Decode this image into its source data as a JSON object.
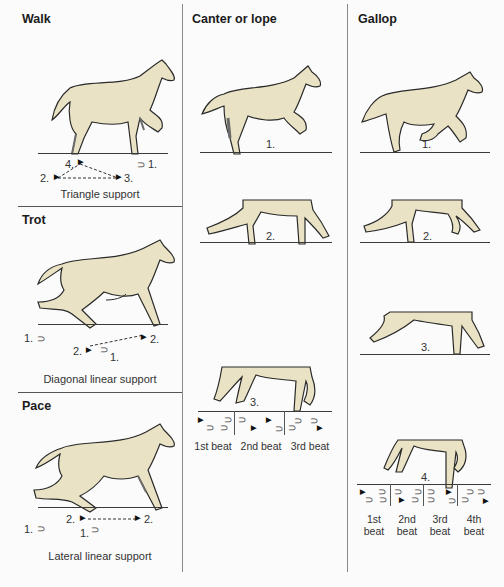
{
  "colors": {
    "background": "#fbfbfb",
    "horse_fill": "#e9e2c4",
    "outline": "#2a2a2a",
    "shadow": "#6b6b6b",
    "divider": "#8a8a8a"
  },
  "columns": [
    {
      "id": "left",
      "sections": [
        {
          "title": "Walk",
          "caption": "Triangle support",
          "footfall_labels": [
            "4.",
            "1.",
            "2.",
            "3."
          ]
        },
        {
          "title": "Trot",
          "caption": "Diagonal linear support",
          "footfall_labels": [
            "1.",
            "2.",
            "2.",
            "1."
          ]
        },
        {
          "title": "Pace",
          "caption": "Lateral linear support",
          "footfall_labels": [
            "2.",
            "2.",
            "1.",
            "1."
          ]
        }
      ]
    },
    {
      "id": "middle",
      "title": "Canter or lope",
      "phases": [
        "1.",
        "2.",
        "3."
      ],
      "beats": [
        "1st beat",
        "2nd beat",
        "3rd beat"
      ]
    },
    {
      "id": "right",
      "title": "Gallop",
      "phases": [
        "1.",
        "2.",
        "3.",
        "4."
      ],
      "beats": [
        {
          "line1": "1st",
          "line2": "beat"
        },
        {
          "line1": "2nd",
          "line2": "beat"
        },
        {
          "line1": "3rd",
          "line2": "beat"
        },
        {
          "line1": "4th",
          "line2": "beat"
        }
      ]
    }
  ],
  "icons": {
    "hoof_open": "⊃",
    "hoof_solid": "▶"
  }
}
